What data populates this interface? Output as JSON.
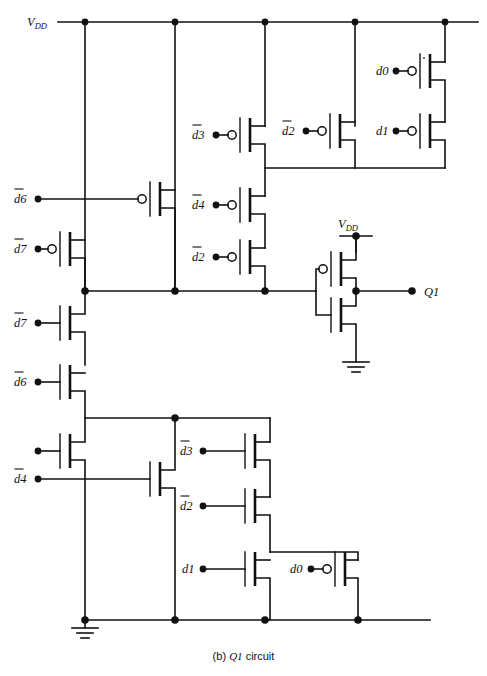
{
  "figure": {
    "caption_prefix": "(b)",
    "caption_signal": "Q1",
    "caption_suffix": "circuit",
    "caption_full": "(b) Q1 circuit",
    "type": "cmos-transistor-level-schematic",
    "ink_color": "#111111",
    "background_color": "#ffffff"
  },
  "rails": {
    "vdd_label": "V",
    "vdd_sub": "DD",
    "vdd_label_full": "VDD",
    "inverter_vdd_label": "V",
    "inverter_vdd_sub": "DD",
    "gnd_label": "ground"
  },
  "output": {
    "label": "Q1",
    "terminal_name": "Q1-output-terminal"
  },
  "pullup_network": {
    "description": "PMOS pull-up network between VDD and the internal node",
    "devices": [
      {
        "id": "p-d6-top",
        "label": "d",
        "index": "6",
        "overbar": true,
        "bubble": true,
        "column": "col-a"
      },
      {
        "id": "p-d7",
        "label": "d",
        "index": "7",
        "overbar": true,
        "bubble": true,
        "column": "col-left"
      },
      {
        "id": "p-d3",
        "label": "d",
        "index": "3",
        "overbar": true,
        "bubble": true,
        "column": "col-c"
      },
      {
        "id": "p-d4",
        "label": "d",
        "index": "4",
        "overbar": true,
        "bubble": true,
        "column": "col-c"
      },
      {
        "id": "p-d2-low",
        "label": "d",
        "index": "2",
        "overbar": true,
        "bubble": true,
        "column": "col-c"
      },
      {
        "id": "p-d2-top",
        "label": "d",
        "index": "2",
        "overbar": true,
        "bubble": true,
        "column": "col-d"
      },
      {
        "id": "p-d0",
        "label": "d",
        "index": "0",
        "overbar": false,
        "bubble": true,
        "column": "col-e"
      },
      {
        "id": "p-d1",
        "label": "d",
        "index": "1",
        "overbar": false,
        "bubble": true,
        "column": "col-e"
      }
    ]
  },
  "pulldown_network": {
    "description": "NMOS pull-down network between the internal node and ground",
    "devices": [
      {
        "id": "n-d7",
        "label": "d",
        "index": "7",
        "overbar": true,
        "bubble": false,
        "column": "col-left"
      },
      {
        "id": "n-d6",
        "label": "d",
        "index": "6",
        "overbar": true,
        "bubble": false,
        "column": "col-left"
      },
      {
        "id": "n-unl",
        "label": "",
        "index": "",
        "overbar": false,
        "bubble": false,
        "column": "col-left"
      },
      {
        "id": "n-d4",
        "label": "d",
        "index": "4",
        "overbar": true,
        "bubble": false,
        "column": "col-b"
      },
      {
        "id": "n-d3",
        "label": "d",
        "index": "3",
        "overbar": true,
        "bubble": false,
        "column": "col-c"
      },
      {
        "id": "n-d2",
        "label": "d",
        "index": "2",
        "overbar": true,
        "bubble": false,
        "column": "col-c"
      },
      {
        "id": "n-d1",
        "label": "d",
        "index": "1",
        "overbar": false,
        "bubble": false,
        "column": "col-c"
      },
      {
        "id": "n-d0",
        "label": "d",
        "index": "0",
        "overbar": false,
        "bubble": true,
        "column": "col-d"
      }
    ]
  },
  "output_inverter": {
    "description": "Final CMOS inverter driving Q1",
    "pmos": {
      "id": "inv-p",
      "bubble": true
    },
    "nmos": {
      "id": "inv-n",
      "bubble": false
    }
  }
}
